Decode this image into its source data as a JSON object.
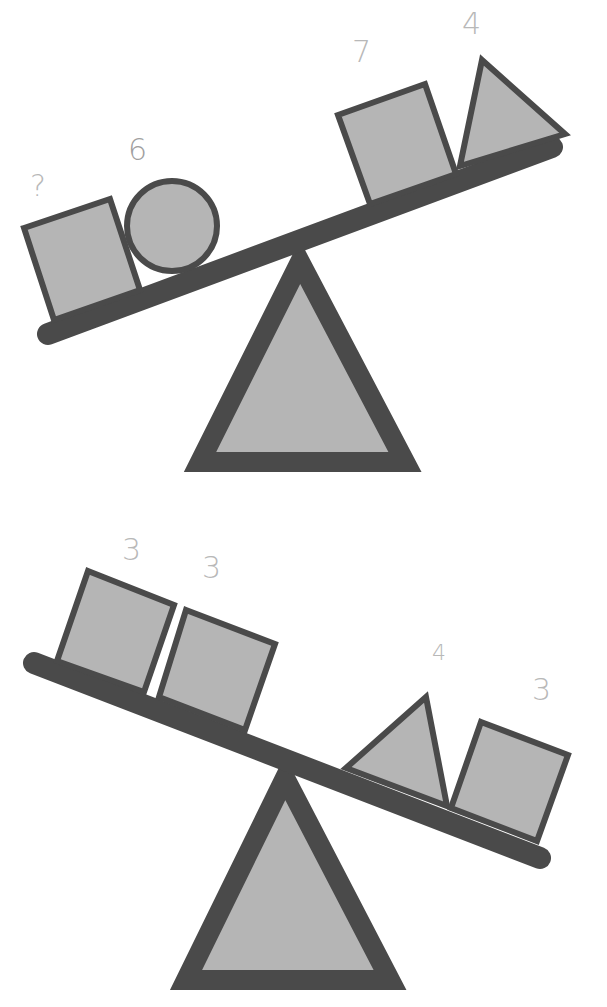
{
  "colors": {
    "stroke": "#4a4a4a",
    "fill": "#b5b5b5",
    "label": "#b0b0b0",
    "background": "#ffffff"
  },
  "seesaws": [
    {
      "name": "top-seesaw",
      "tilt": "left side down",
      "left_items": [
        {
          "shape": "square",
          "label": "?"
        },
        {
          "shape": "circle",
          "label": "6"
        }
      ],
      "right_items": [
        {
          "shape": "square",
          "label": "7"
        },
        {
          "shape": "triangle",
          "label": "4"
        }
      ]
    },
    {
      "name": "bottom-seesaw",
      "tilt": "right side down",
      "left_items": [
        {
          "shape": "square",
          "label": "3"
        },
        {
          "shape": "square",
          "label": "3"
        }
      ],
      "right_items": [
        {
          "shape": "triangle",
          "label": "4"
        },
        {
          "shape": "square",
          "label": "3"
        }
      ]
    }
  ]
}
